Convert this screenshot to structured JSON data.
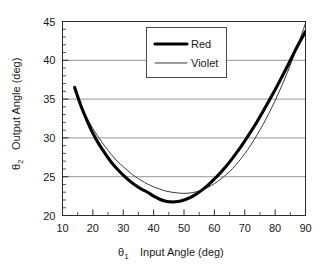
{
  "chart_data": {
    "type": "line",
    "title": "",
    "xlabel": "θ₁   Input Angle (deg)",
    "ylabel": "θ₂   Output Angle (deg)",
    "xlim": [
      10,
      90
    ],
    "ylim": [
      20,
      45
    ],
    "xticks": [
      10,
      20,
      30,
      40,
      50,
      60,
      70,
      80,
      90
    ],
    "xtick_labels": [
      "10",
      "20",
      "30",
      "40",
      "50",
      "60",
      "70",
      "80",
      "90"
    ],
    "yticks": [
      20,
      25,
      30,
      35,
      40,
      45
    ],
    "ytick_labels": [
      "20",
      "25",
      "30",
      "35",
      "40",
      "45"
    ],
    "minor_tick_interval_x": 5,
    "minor_tick_interval_y": 1,
    "grid": "horizontal",
    "legend_position": "top-center",
    "legend_entries": [
      "Red",
      "Violet"
    ],
    "series": [
      {
        "name": "Red",
        "line_style": "thick-solid",
        "color": "#000000",
        "x": [
          14,
          16,
          18,
          20,
          22,
          24,
          26,
          28,
          30,
          32,
          34,
          36,
          38,
          40,
          42,
          44,
          46,
          48,
          50,
          52,
          54,
          56,
          58,
          60,
          62,
          64,
          66,
          68,
          70,
          72,
          74,
          76,
          78,
          80,
          82,
          84,
          86,
          88,
          90
        ],
        "y": [
          36.5,
          34.2,
          32.3,
          30.6,
          29.2,
          28.0,
          26.9,
          26.0,
          25.2,
          24.5,
          23.9,
          23.4,
          23.0,
          22.5,
          22.1,
          21.85,
          21.75,
          21.8,
          22.0,
          22.3,
          22.75,
          23.3,
          23.95,
          24.7,
          25.5,
          26.4,
          27.4,
          28.45,
          29.6,
          30.8,
          32.05,
          33.4,
          34.8,
          36.2,
          37.7,
          39.2,
          40.8,
          42.3,
          43.7
        ]
      },
      {
        "name": "Violet",
        "line_style": "thin-solid",
        "color": "#3a3a3a",
        "x": [
          16,
          18,
          20,
          22,
          24,
          26,
          28,
          30,
          32,
          34,
          36,
          38,
          40,
          42,
          44,
          46,
          48,
          50,
          52,
          54,
          56,
          58,
          60,
          62,
          64,
          66,
          68,
          70,
          72,
          74,
          76,
          78,
          80,
          82,
          84,
          86,
          88,
          90
        ],
        "y": [
          34.2,
          32.6,
          31.2,
          30.0,
          28.9,
          27.9,
          27.0,
          26.3,
          25.6,
          25.0,
          24.5,
          24.05,
          23.7,
          23.4,
          23.15,
          23.0,
          22.9,
          22.85,
          22.9,
          23.05,
          23.3,
          23.65,
          24.1,
          24.65,
          25.3,
          26.05,
          26.95,
          27.95,
          29.1,
          30.35,
          31.7,
          33.2,
          34.8,
          36.55,
          38.4,
          40.4,
          42.5,
          44.8
        ]
      }
    ]
  },
  "legend": {
    "red_label": "Red",
    "violet_label": "Violet"
  },
  "axes": {
    "x_title": "θ₁   Input Angle (deg)",
    "x_symbol": "θ",
    "x_subscript": "1",
    "x_title_text": "Input Angle (deg)",
    "y_symbol": "θ",
    "y_subscript": "2",
    "y_title_text": "Output Angle (deg)"
  }
}
